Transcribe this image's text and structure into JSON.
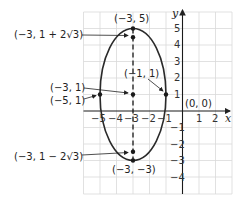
{
  "diagram": {
    "type": "ellipse-on-coordinate-grid",
    "axes": {
      "x_label": "x",
      "y_label": "y",
      "x_ticks": [
        "-5",
        "-4",
        "-3",
        "-2",
        "-1",
        "1",
        "2"
      ],
      "y_ticks": [
        "5",
        "4",
        "3",
        "2",
        "1",
        "-1",
        "-2",
        "-3",
        "-4"
      ]
    },
    "ellipse": {
      "center": [
        -3,
        1
      ],
      "semi_major_vertical": 4,
      "semi_minor_horizontal": 2
    },
    "points": [
      {
        "label": "(-3, 5)",
        "x": -3,
        "y": 5
      },
      {
        "label": "(-3, 1 + 2√3)",
        "x": -3,
        "y": 4.464
      },
      {
        "label": "(-3, 1)",
        "x": -3,
        "y": 1
      },
      {
        "label": "(-5, 1)",
        "x": -5,
        "y": 1
      },
      {
        "label": "(-1, 1)",
        "x": -1,
        "y": 1
      },
      {
        "label": "(-3, 1 − 2√3)",
        "x": -3,
        "y": -2.464
      },
      {
        "label": "(-3, -3)",
        "x": -3,
        "y": -3
      }
    ],
    "labels": {
      "top_vertex": "(−3, 5)",
      "focus_upper": "(−3, 1 + 2√3)",
      "center": "(−3, 1)",
      "left_vertex": "(−5, 1)",
      "right_vertex": "(−1, 1)",
      "origin": "(0, 0)",
      "focus_lower": "(−3, 1 − 2√3)",
      "bottom_vertex": "(−3, −3)"
    },
    "tick_labels": {
      "xm5": "−5",
      "xm4": "−4",
      "xm3": "−3",
      "xm2": "−2",
      "xm1": "−1",
      "x1": "1",
      "x2": "2",
      "y5": "5",
      "y4": "4",
      "y3": "3",
      "y2": "2",
      "y1": "1",
      "ym1": "−1",
      "ym2": "−2",
      "ym3": "−3",
      "ym4": "−4"
    },
    "colors": {
      "grid": "#d9d9d9",
      "axis": "#1a1a1a",
      "curve": "#2a2a2a",
      "text": "#222222"
    }
  }
}
